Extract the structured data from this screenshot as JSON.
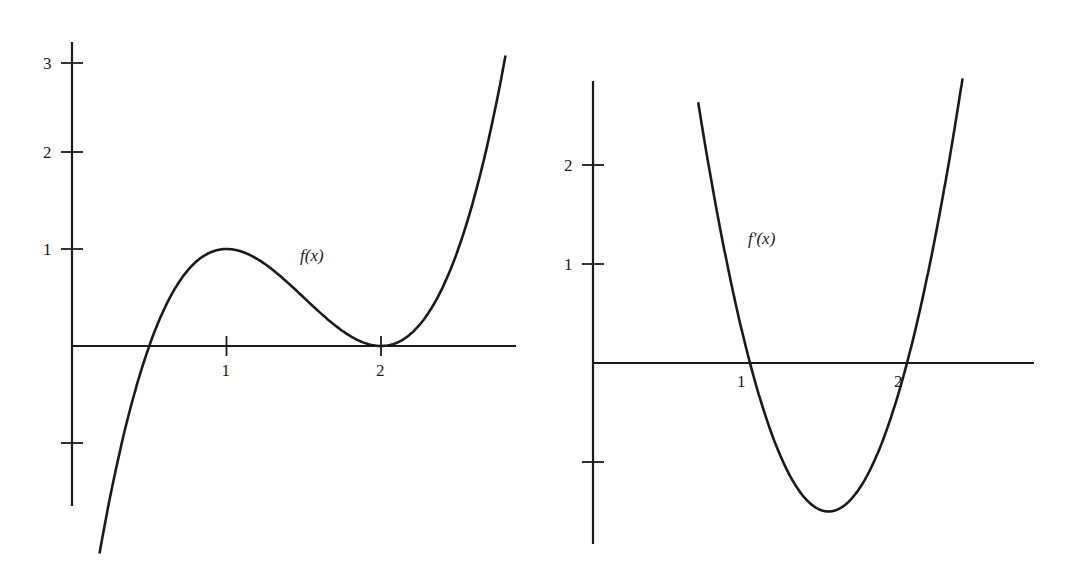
{
  "chart_data": [
    {
      "type": "line",
      "title": "",
      "curve_label": "f(x)",
      "formula": "(x-2)^2(2x-1)",
      "xlabel": "",
      "ylabel": "",
      "x_ticks": [
        {
          "value": 1,
          "label": "1"
        },
        {
          "value": 2,
          "label": "2"
        }
      ],
      "y_ticks": [
        {
          "value": 3,
          "label": "3"
        },
        {
          "value": 2,
          "label": "2"
        },
        {
          "value": 1,
          "label": "1"
        },
        {
          "value": -1,
          "label": ""
        }
      ],
      "xlim": [
        0,
        2.8
      ],
      "ylim": [
        -1.7,
        3.2
      ],
      "key_points": [
        {
          "x": 0.5,
          "y": 0,
          "note": "root"
        },
        {
          "x": 1,
          "y": 1,
          "note": "local max"
        },
        {
          "x": 2,
          "y": 0,
          "note": "local min / double root"
        }
      ],
      "series": [
        {
          "name": "f(x)",
          "x": [
            0.16,
            0.5,
            0.75,
            1,
            1.25,
            1.5,
            1.75,
            2,
            2.25,
            2.5,
            2.85
          ],
          "y": [
            -2.1,
            0,
            0.28,
            1,
            0.84,
            0.5,
            0.16,
            0,
            0.22,
            1.0,
            3.2
          ]
        }
      ]
    },
    {
      "type": "line",
      "title": "",
      "curve_label": "f′(x)",
      "formula": "6(x-1)(x-2)",
      "xlabel": "",
      "ylabel": "",
      "x_ticks": [
        {
          "value": 1,
          "label": "1"
        },
        {
          "value": 2,
          "label": "2"
        }
      ],
      "y_ticks": [
        {
          "value": 2,
          "label": "2"
        },
        {
          "value": 1,
          "label": "1"
        },
        {
          "value": -1,
          "label": ""
        }
      ],
      "xlim": [
        0,
        2.9
      ],
      "ylim": [
        -1.8,
        2.8
      ],
      "key_points": [
        {
          "x": 1,
          "y": 0,
          "note": "root"
        },
        {
          "x": 1.5,
          "y": -1.5,
          "note": "minimum"
        },
        {
          "x": 2,
          "y": 0,
          "note": "root"
        }
      ],
      "series": [
        {
          "name": "f′(x)",
          "x": [
            0.67,
            1,
            1.25,
            1.5,
            1.75,
            2,
            2.25,
            2.4
          ],
          "y": [
            2.9,
            0,
            -1.1,
            -1.5,
            -1.1,
            0,
            1.9,
            2.9
          ]
        }
      ]
    }
  ],
  "style": {
    "ink": "#1a1a1a",
    "background": "#ffffff"
  }
}
